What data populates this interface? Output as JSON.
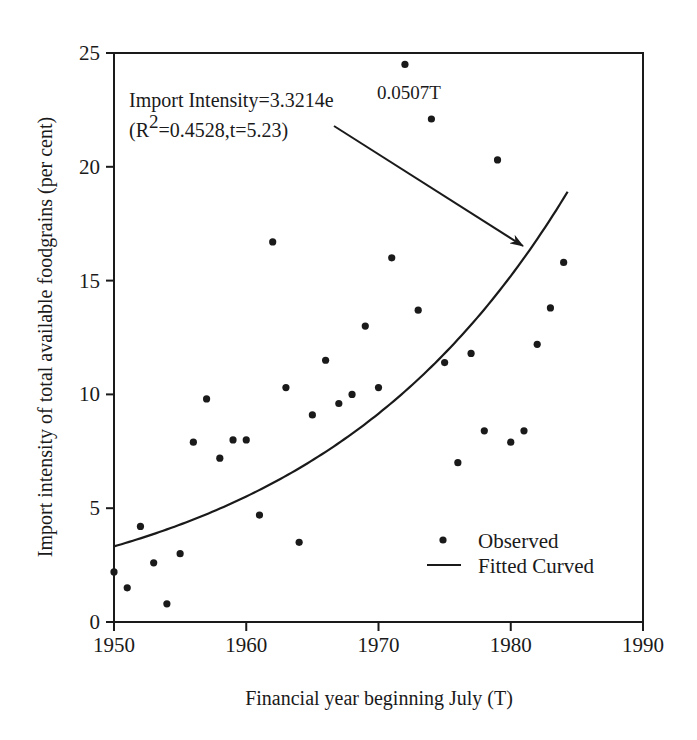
{
  "chart_data": {
    "type": "scatter",
    "title": "",
    "xlabel": "Financial year beginning July (T)",
    "ylabel": "Import intensity of total available foodgrains (per cent)",
    "xlim": [
      1950,
      1990
    ],
    "ylim": [
      0,
      25
    ],
    "x_ticks": [
      1950,
      1960,
      1970,
      1980,
      1990
    ],
    "y_ticks": [
      0,
      5,
      10,
      15,
      20,
      25
    ],
    "grid": false,
    "legend_position": "lower right",
    "series": [
      {
        "name": "Observed",
        "marker": "dot",
        "x": [
          1950,
          1951,
          1952,
          1953,
          1954,
          1955,
          1956,
          1957,
          1958,
          1959,
          1960,
          1961,
          1962,
          1963,
          1964,
          1965,
          1966,
          1967,
          1968,
          1969,
          1970,
          1971,
          1972,
          1973,
          1974,
          1975,
          1976,
          1977,
          1978,
          1979,
          1980,
          1981,
          1982,
          1983,
          1984
        ],
        "y": [
          2.2,
          1.5,
          4.2,
          2.6,
          0.8,
          3.0,
          7.9,
          9.8,
          7.2,
          8.0,
          8.0,
          4.7,
          16.7,
          10.3,
          3.5,
          9.1,
          11.5,
          9.6,
          10.0,
          13.0,
          10.3,
          16.0,
          24.5,
          13.7,
          22.1,
          11.4,
          7.0,
          11.8,
          8.4,
          20.3,
          7.9,
          8.4,
          12.2,
          13.8,
          15.8
        ]
      },
      {
        "name": "Fitted Curved",
        "type": "line",
        "equation": "Import Intensity = 3.3214 e^(0.0507T)",
        "a": 3.3214,
        "b": 0.0507,
        "x_start": 1950,
        "x_end": 1984.3
      }
    ],
    "annotations": [
      {
        "text_line1_main": "Import Intensity=3.3214e",
        "text_line1_sup": "0.0507T",
        "text_line2_prefix": "(R",
        "text_line2_sup": "2",
        "text_line2_rest": "=0.4528,t=5.23)",
        "arrow_from": [
          1966.1,
          21.8
        ],
        "arrow_to": [
          1980.8,
          16.5
        ]
      }
    ],
    "legend": [
      {
        "label": "Observed",
        "symbol": "dot"
      },
      {
        "label": "Fitted Curved",
        "symbol": "line"
      }
    ]
  },
  "colors": {
    "ink": "#1a1a1a",
    "background": "#ffffff"
  }
}
